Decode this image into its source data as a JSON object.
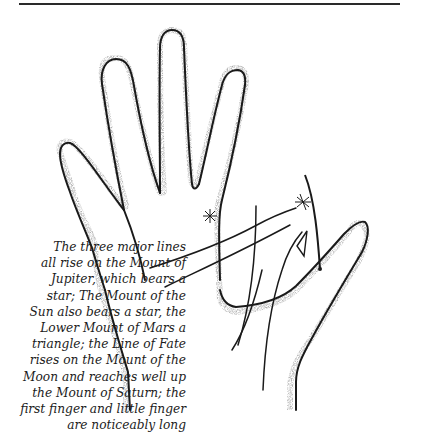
{
  "figure": {
    "caption_lines": [
      "The three major lines",
      "all rise on the Mount of",
      "Jupiter, which bears a",
      "star; The Mount of the",
      "Sun also bears a star, the",
      "Lower Mount of Mars a",
      "triangle; the Line of Fate",
      "rises on the Mount of the",
      "Moon and reaches well up",
      "the Mount of Saturn; the",
      "first finger and little finger",
      "are noticeably long"
    ],
    "illustration": "hand-palm-drawing",
    "markings": [
      "star-mount-of-jupiter",
      "star-mount-of-sun",
      "triangle-lower-mount-of-mars"
    ]
  },
  "colors": {
    "ink": "#1c1c1c",
    "background": "#ffffff"
  }
}
